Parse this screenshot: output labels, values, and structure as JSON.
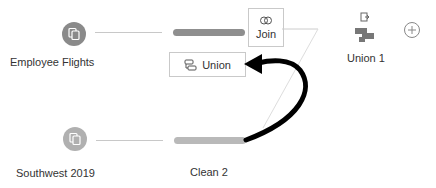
{
  "flow": {
    "inputs": [
      {
        "label": "Employee Flights",
        "icon": "input-data-icon",
        "color": "#8a8a8a"
      },
      {
        "label": "Southwest 2019",
        "icon": "input-data-icon",
        "color": "#a8a8a8"
      }
    ],
    "steps": {
      "join": {
        "label": "Join",
        "icon": "join-icon"
      },
      "union_drop": {
        "label": "Union",
        "icon": "union-icon"
      },
      "clean2": {
        "label": "Clean 2"
      },
      "union1": {
        "label": "Union 1",
        "icon": "union-step-icon"
      }
    },
    "add_button": {
      "icon": "plus-icon"
    },
    "colors": {
      "bar_top": "#8f8f8f",
      "bar_bottom": "#b9b9b9",
      "arrow": "#000000"
    }
  }
}
